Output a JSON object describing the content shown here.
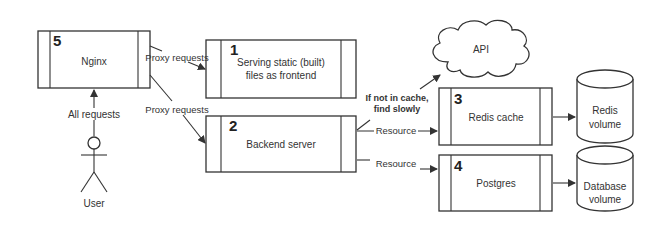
{
  "nodes": {
    "nginx": {
      "number": "5",
      "label": "Nginx"
    },
    "frontend": {
      "number": "1",
      "line1": "Serving static (built)",
      "line2": "files as frontend"
    },
    "backend": {
      "number": "2",
      "label": "Backend server"
    },
    "redis": {
      "number": "3",
      "label": "Redis cache"
    },
    "postgres": {
      "number": "4",
      "label": "Postgres"
    },
    "api": {
      "label": "API"
    },
    "redis_volume": {
      "line1": "Redis",
      "line2": "volume"
    },
    "db_volume": {
      "line1": "Database",
      "line2": "volume"
    },
    "user": {
      "label": "User"
    }
  },
  "edges": {
    "user_to_nginx": "All requests",
    "nginx_to_frontend": "Proxy requests",
    "nginx_to_backend": "Proxy requests",
    "backend_to_api_line1": "If not in cache,",
    "backend_to_api_line2": "find slowly",
    "backend_to_redis": "Resource",
    "backend_to_postgres": "Resource"
  },
  "colors": {
    "stroke": "#333333",
    "background": "#ffffff"
  }
}
